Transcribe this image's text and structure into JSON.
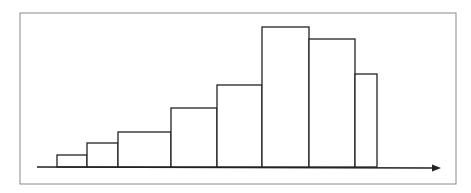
{
  "chart_data": {
    "type": "bar",
    "subtype": "histogram",
    "title": "",
    "xlabel": "",
    "ylabel": "",
    "categories": [
      "1",
      "2",
      "3",
      "4",
      "5",
      "6",
      "7",
      "8"
    ],
    "bin_edges_px": [
      57,
      87,
      118,
      171,
      217,
      262,
      309,
      355,
      377
    ],
    "values": [
      12,
      24,
      35,
      59,
      82,
      140,
      128,
      93
    ],
    "ylim": [
      0,
      150
    ],
    "grid": false,
    "legend": null,
    "bar_fill": "#ffffff",
    "bar_stroke": "#222222",
    "frame_stroke": "#888888",
    "axis_arrow": true
  }
}
